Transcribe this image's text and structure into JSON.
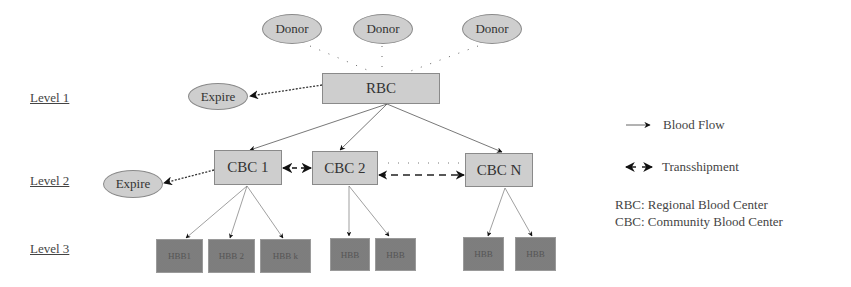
{
  "diagram": {
    "levels": [
      {
        "label": "Level 1"
      },
      {
        "label": "Level 2"
      },
      {
        "label": "Level 3"
      }
    ],
    "donors": [
      {
        "label": "Donor"
      },
      {
        "label": "Donor"
      },
      {
        "label": "Donor"
      }
    ],
    "rbc": {
      "label": "RBC"
    },
    "expire_nodes": [
      {
        "label": "Expire"
      },
      {
        "label": "Expire"
      }
    ],
    "cbcs": [
      {
        "label": "CBC 1"
      },
      {
        "label": "CBC 2"
      },
      {
        "label": "CBC N"
      }
    ],
    "hbbs": [
      {
        "label": "HBB1",
        "parent": "CBC 1"
      },
      {
        "label": "HBB 2",
        "parent": "CBC 1"
      },
      {
        "label": "HBB k",
        "parent": "CBC 1"
      },
      {
        "label": "HBB",
        "parent": "CBC 2"
      },
      {
        "label": "HBB",
        "parent": "CBC 2"
      },
      {
        "label": "HBB",
        "parent": "CBC N"
      },
      {
        "label": "HBB",
        "parent": "CBC N"
      }
    ]
  },
  "legend": {
    "items": [
      {
        "label": "Blood Flow",
        "symbol": "single-arrow"
      },
      {
        "label": "Transshipment",
        "symbol": "double-arrow"
      }
    ],
    "abbreviations": [
      {
        "text": "RBC: Regional Blood Center"
      },
      {
        "text": "CBC: Community Blood Center"
      }
    ]
  }
}
